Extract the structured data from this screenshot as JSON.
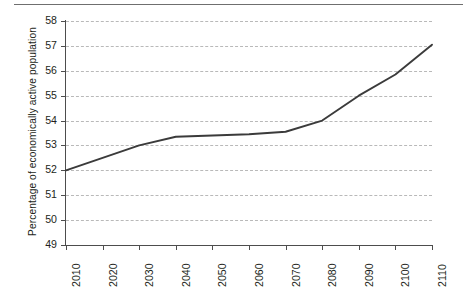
{
  "chart_data": {
    "type": "line",
    "title": "",
    "xlabel": "",
    "ylabel": "Percentage of economically active population",
    "x": [
      2010,
      2020,
      2030,
      2040,
      2050,
      2060,
      2070,
      2080,
      2090,
      2100,
      2110
    ],
    "categories": [
      "2010",
      "2020",
      "2030",
      "2040",
      "2050",
      "2060",
      "2070",
      "2080",
      "2090",
      "2100",
      "2110"
    ],
    "values": [
      52.0,
      52.5,
      53.0,
      53.35,
      53.4,
      53.45,
      53.55,
      54.0,
      55.0,
      55.85,
      57.05
    ],
    "series": [
      {
        "name": "Percentage of economically active population",
        "values": [
          52.0,
          52.5,
          53.0,
          53.35,
          53.4,
          53.45,
          53.55,
          54.0,
          55.0,
          55.85,
          57.05
        ]
      }
    ],
    "ylim": [
      49,
      58
    ],
    "xlim": [
      2010,
      2110
    ],
    "ytick_labels": [
      "58",
      "57",
      "56",
      "55",
      "54",
      "53",
      "52",
      "51",
      "50",
      "49"
    ],
    "yticks": [
      58,
      57,
      56,
      55,
      54,
      53,
      52,
      51,
      50,
      49
    ],
    "xticks": [
      2010,
      2020,
      2030,
      2040,
      2050,
      2060,
      2070,
      2080,
      2090,
      2100,
      2110
    ],
    "grid": "horizontal-dashed",
    "legend": "none",
    "line_color": "#3b3b3b",
    "grid_color": "#b9b9b9",
    "axis_color": "#4d4d4d",
    "background": "#ffffff"
  },
  "figure": {
    "top_rule": "",
    "caption_fragment": ""
  }
}
